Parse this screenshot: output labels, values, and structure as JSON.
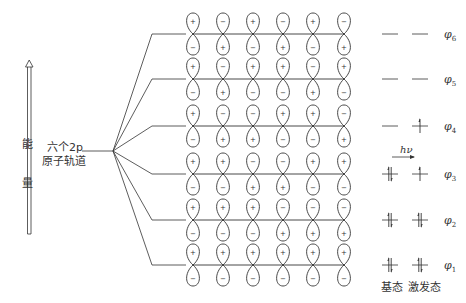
{
  "energy_axis": {
    "label_top": "能",
    "label_bottom": "量"
  },
  "atomic_orbitals": {
    "line1": "六个2p",
    "line2": "原子轨道"
  },
  "mo_rows": [
    {
      "name": "φ6",
      "symbol": "φ",
      "sub": "6",
      "top": [
        "+",
        "−",
        "+",
        "−",
        "+",
        "−"
      ],
      "ground": [],
      "excited": []
    },
    {
      "name": "φ5",
      "symbol": "φ",
      "sub": "5",
      "top": [
        "+",
        "−",
        "+",
        "+",
        "−",
        "+"
      ],
      "ground": [],
      "excited": []
    },
    {
      "name": "φ4",
      "symbol": "φ",
      "sub": "4",
      "top": [
        "+",
        "−",
        "−",
        "+",
        "+",
        "−"
      ],
      "ground": [],
      "excited": [
        "up"
      ]
    },
    {
      "name": "φ3",
      "symbol": "φ",
      "sub": "3",
      "top": [
        "+",
        "+",
        "−",
        "−",
        "+",
        "+"
      ],
      "ground": [
        "up",
        "down"
      ],
      "excited": [
        "up"
      ]
    },
    {
      "name": "φ2",
      "symbol": "φ",
      "sub": "2",
      "top": [
        "+",
        "+",
        "+",
        "−",
        "−",
        "−"
      ],
      "ground": [
        "up",
        "down"
      ],
      "excited": [
        "up",
        "down"
      ]
    },
    {
      "name": "φ1",
      "symbol": "φ",
      "sub": "1",
      "top": [
        "+",
        "+",
        "+",
        "+",
        "+",
        "+"
      ],
      "ground": [
        "up",
        "down"
      ],
      "excited": [
        "up",
        "down"
      ]
    }
  ],
  "excitation": {
    "label": "hν"
  },
  "state_labels": {
    "ground": "基态",
    "excited": "激发态"
  },
  "colors": {
    "line": "#333333"
  }
}
